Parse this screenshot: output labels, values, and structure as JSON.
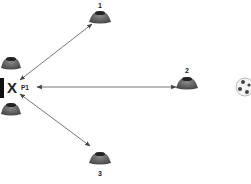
{
  "diagram": {
    "player": {
      "marker": "X",
      "label": "P1"
    },
    "cones": [
      {
        "label": "1"
      },
      {
        "label": "2"
      },
      {
        "label": "3"
      }
    ],
    "colors": {
      "cone": "#5a5a5a",
      "cone_top": "#2a2a2a",
      "arrow": "#555555",
      "marker": "#222222",
      "goal": "#111111"
    }
  }
}
